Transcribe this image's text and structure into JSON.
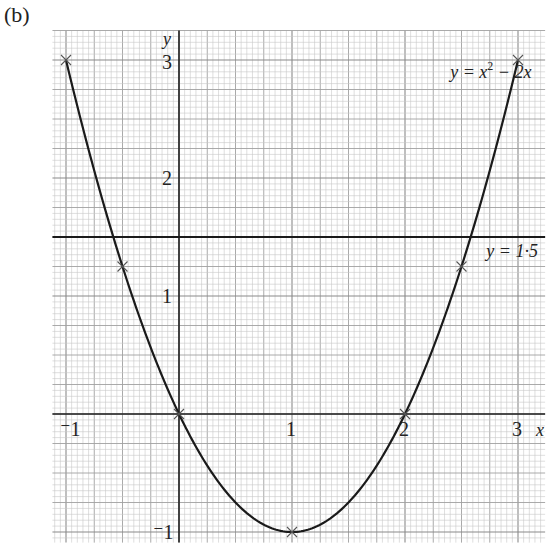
{
  "part_label": "(b)",
  "chart_data": {
    "type": "line",
    "title": "",
    "xlabel": "x",
    "ylabel": "y",
    "xlim": [
      -1.12,
      3.24
    ],
    "ylim": [
      -1.09,
      3.25
    ],
    "x_ticks": [
      {
        "value": -1,
        "label": "⁻1"
      },
      {
        "value": 1,
        "label": "1"
      },
      {
        "value": 2,
        "label": "2"
      },
      {
        "value": 3,
        "label": "3"
      }
    ],
    "y_ticks": [
      {
        "value": -1,
        "label": "⁻1"
      },
      {
        "value": 1,
        "label": "1"
      },
      {
        "value": 2,
        "label": "2"
      },
      {
        "value": 3,
        "label": "3"
      }
    ],
    "grid": {
      "on": true,
      "minor_per_unit": 20,
      "major_every_minor": 5,
      "style": "graph paper"
    },
    "series": [
      {
        "name": "y = x² − 2x",
        "label_parts": {
          "lhs": "y = x",
          "exp": "2",
          "rhs": " − 2x"
        },
        "function": "x^2 - 2x",
        "x_range": [
          -1,
          3
        ],
        "plotted_points": [
          {
            "x": -1,
            "y": 3
          },
          {
            "x": -0.5,
            "y": 1.25
          },
          {
            "x": 0,
            "y": 0
          },
          {
            "x": 1,
            "y": -1
          },
          {
            "x": 2,
            "y": 0
          },
          {
            "x": 2.5,
            "y": 1.25
          },
          {
            "x": 3,
            "y": 3
          }
        ],
        "color": "#1a1a1a"
      },
      {
        "name": "y = 1·5",
        "function": "1.5",
        "x_range": [
          -1.12,
          3.24
        ],
        "color": "#1a1a1a"
      }
    ],
    "annotations": [
      {
        "text": "y = x² − 2x",
        "x": 2.4,
        "y": 2.85
      },
      {
        "text": "y = 1·5",
        "x": 2.72,
        "y": 1.33
      }
    ],
    "legend": null
  }
}
